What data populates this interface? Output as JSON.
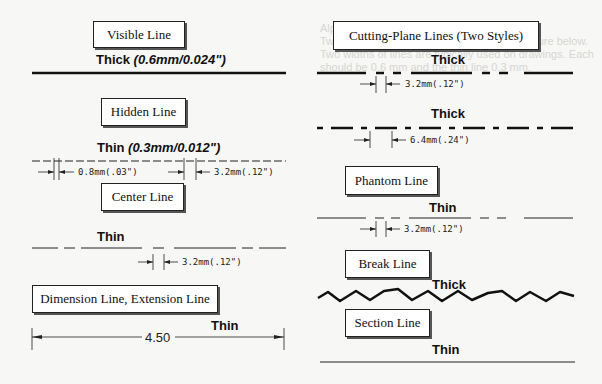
{
  "background_text": "Alphabet of Lines\nTwo line widths are used, as shown in the figure below. Two widths of lines are typically used on drawings. Each should be 0.6 mm and the thin line 0.3 mm.",
  "left": {
    "visible": {
      "title": "Visible Line",
      "weight": "Thick",
      "spec": "(0.6mm/0.024\")"
    },
    "hidden": {
      "title": "Hidden Line",
      "weight": "Thin",
      "spec": "(0.3mm/0.012\")",
      "gap_dim": "0.8mm(.03\")",
      "dash_dim": "3.2mm(.12\")"
    },
    "center": {
      "title": "Center Line",
      "weight": "Thin",
      "dim": "3.2mm(.12\")"
    },
    "dimension": {
      "title": "Dimension Line, Extension Line",
      "weight": "Thin",
      "value": "4.50"
    }
  },
  "right": {
    "cutting": {
      "title": "Cutting-Plane Lines (Two Styles)",
      "weight1": "Thick",
      "dim1": "3.2mm(.12\")",
      "weight2": "Thick",
      "dim2": "6.4mm(.24\")"
    },
    "phantom": {
      "title": "Phantom Line",
      "weight": "Thin",
      "dim": "3.2mm(.12\")"
    },
    "break": {
      "title": "Break Line",
      "weight": "Thick"
    },
    "section": {
      "title": "Section Line",
      "weight": "Thin"
    }
  }
}
